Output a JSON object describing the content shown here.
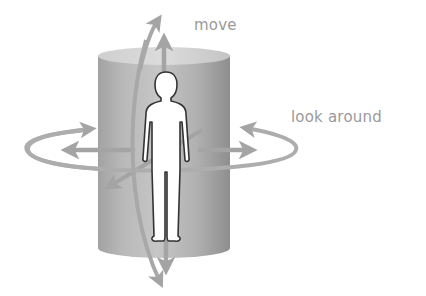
{
  "diagram": {
    "title": "",
    "labels": {
      "move": "move",
      "look_around": "look around"
    },
    "elements": {
      "cylinder": "gray cylinder representing the viewer's surrounding view volume",
      "figure": "standing human figure (viewer) at center",
      "move_arrows": "vertical and curved arrows indicating movement up/down",
      "look_arrows": "horizontal ellipse with arrows indicating rotation / looking around",
      "depth_arrow": "diagonal arrow indicating forward/backward direction"
    },
    "colors": {
      "background": "#ffffff",
      "cylinder_dark": "#9c9c9c",
      "cylinder_light": "#c4c4c4",
      "cylinder_top": "#d2d2d2",
      "arrow": "#a8a8a8",
      "figure_fill": "#ffffff",
      "figure_outline": "#333333",
      "label_text": "#9a9a9a"
    }
  }
}
